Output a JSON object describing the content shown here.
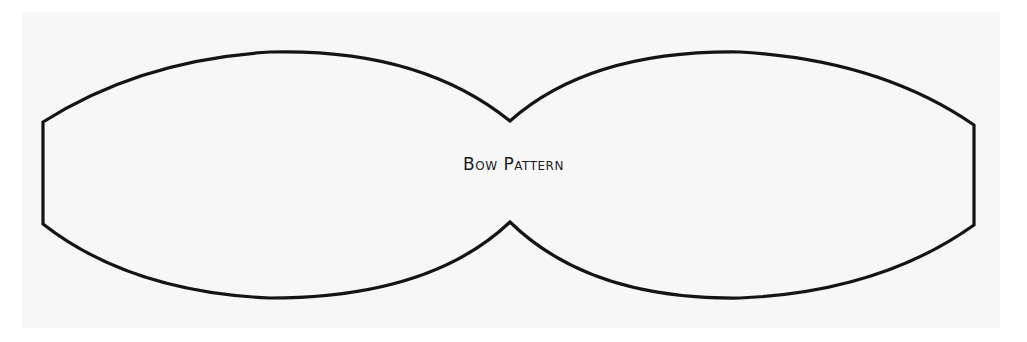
{
  "document": {
    "title": "Bow Pattern",
    "paper_color": "#f7f7f7",
    "outline_color": "#141414"
  },
  "pattern": {
    "label": "Bow Pattern",
    "shape": "bow-outline",
    "parts": [
      "left-lobe",
      "right-lobe",
      "center-pinch"
    ]
  }
}
